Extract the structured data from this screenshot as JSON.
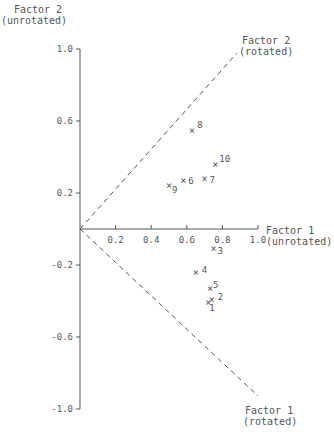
{
  "chart_data": {
    "type": "scatter",
    "title": "",
    "xlabel": "Factor 1 (unrotated)",
    "ylabel": "Factor 2 (unrotated)",
    "xlabel_lines": [
      "Factor 1",
      "(unrotated)"
    ],
    "ylabel_lines": [
      "Factor 2",
      "(unrotated)"
    ],
    "xlim": [
      0,
      1.0
    ],
    "ylim": [
      -1.0,
      1.0
    ],
    "x_ticks": [
      0.2,
      0.4,
      0.6,
      0.8,
      1.0
    ],
    "x_tick_labels": [
      "0.2",
      "0.4",
      "0.6",
      "0.8",
      "1.0"
    ],
    "y_ticks": [
      1.0,
      0.6,
      0.2,
      -0.2,
      -0.6,
      -1.0
    ],
    "y_tick_labels": [
      "1.0",
      "0.6",
      "0.2",
      "-0.2",
      "-0.6",
      "-1.0"
    ],
    "grid": false,
    "marker": "×",
    "rotated_axes": [
      {
        "name": "Factor 2 (rotated)",
        "label_lines": [
          "Factor 2",
          "(rotated)"
        ],
        "direction": [
          0.89,
          0.99
        ],
        "style": "dashed"
      },
      {
        "name": "Factor 1 (rotated)",
        "label_lines": [
          "Factor 1",
          "(rotated)"
        ],
        "direction": [
          1.0,
          -0.93
        ],
        "style": "dashed"
      }
    ],
    "points": [
      {
        "label": "1",
        "x": 0.72,
        "y": -0.41
      },
      {
        "label": "2",
        "x": 0.74,
        "y": -0.39
      },
      {
        "label": "3",
        "x": 0.75,
        "y": -0.11
      },
      {
        "label": "4",
        "x": 0.65,
        "y": -0.24
      },
      {
        "label": "5",
        "x": 0.73,
        "y": -0.33
      },
      {
        "label": "6",
        "x": 0.58,
        "y": 0.27
      },
      {
        "label": "7",
        "x": 0.7,
        "y": 0.28
      },
      {
        "label": "8",
        "x": 0.63,
        "y": 0.55
      },
      {
        "label": "9",
        "x": 0.5,
        "y": 0.24
      },
      {
        "label": "10",
        "x": 0.76,
        "y": 0.36
      }
    ]
  }
}
